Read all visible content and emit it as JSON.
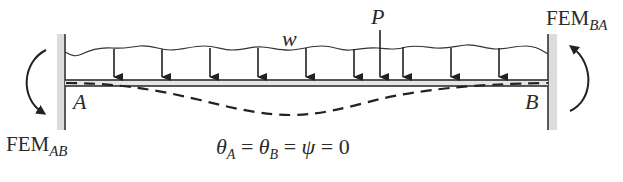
{
  "diagram": {
    "type": "fixed-end beam with distributed and point load",
    "load_labels": {
      "distributed": "w",
      "point": "P"
    },
    "support_labels": {
      "left": "A",
      "right": "B"
    },
    "moments": {
      "left": {
        "base": "FEM",
        "sub": "AB"
      },
      "right": {
        "base": "FEM",
        "sub": "BA"
      }
    },
    "condition": {
      "theta": "θ",
      "sub_a": "A",
      "sub_b": "B",
      "eq1": " = ",
      "eq2": " = ",
      "psi": "ψ",
      "rest": " = 0"
    },
    "colors": {
      "line": "#222222",
      "wall_hatch": "#d9d9d9",
      "beam_fill": "#e6e6e6"
    }
  }
}
